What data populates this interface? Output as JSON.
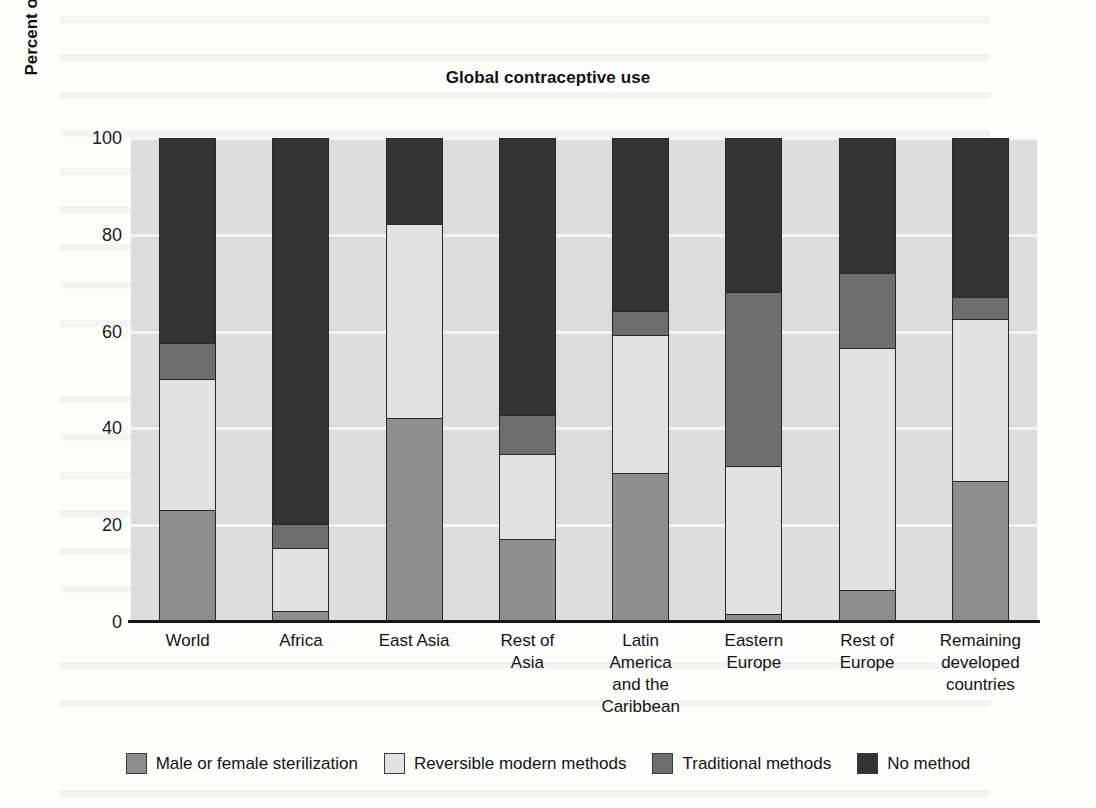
{
  "page": {
    "background_color": "#fdfdfc",
    "plot_background_color": "#dcdcdc",
    "gridline_color": "#f7f7f7"
  },
  "chart_data": {
    "type": "bar",
    "subtype": "stacked-column-100",
    "title": "Global contraceptive use",
    "xlabel": "",
    "ylabel": "Percent of married women ages 15-49",
    "ylim": [
      0,
      100
    ],
    "yticks": [
      0,
      20,
      40,
      60,
      80,
      100
    ],
    "ytick_labels": [
      "0",
      "20",
      "40",
      "60",
      "80",
      "100"
    ],
    "grid": true,
    "legend_position": "bottom",
    "categories": [
      "World",
      "Africa",
      "East Asia",
      "Rest of Asia",
      "Latin America and the Caribbean",
      "Eastern Europe",
      "Rest of Europe",
      "Remaining developed countries"
    ],
    "category_label_lines": [
      [
        "World"
      ],
      [
        "Africa"
      ],
      [
        "East Asia"
      ],
      [
        "Rest of",
        "Asia"
      ],
      [
        "Latin",
        "America",
        "and the",
        "Caribbean"
      ],
      [
        "Eastern",
        "Europe"
      ],
      [
        "Rest of",
        "Europe"
      ],
      [
        "Remaining",
        "developed",
        "countries"
      ]
    ],
    "series": [
      {
        "name": "Male or female sterilization",
        "color": "#8e8e8e",
        "values": [
          23,
          2,
          42,
          17,
          30.5,
          1.5,
          6.5,
          29
        ]
      },
      {
        "name": "Reversible modern methods",
        "color": "#e2e2e2",
        "values": [
          27,
          13,
          40,
          17.5,
          28.5,
          30.5,
          50,
          33.5
        ]
      },
      {
        "name": "Traditional methods",
        "color": "#6e6e6e",
        "values": [
          7.5,
          5,
          0,
          8,
          5,
          36,
          15.5,
          4.5
        ]
      },
      {
        "name": "No method",
        "color": "#333333",
        "values": [
          42.5,
          80,
          18,
          57.5,
          36,
          32,
          28,
          33
        ]
      }
    ]
  },
  "legend": {
    "items": [
      {
        "label": "Male or female sterilization",
        "color": "#8e8e8e"
      },
      {
        "label": "Reversible modern methods",
        "color": "#e2e2e2"
      },
      {
        "label": "Traditional methods",
        "color": "#6e6e6e"
      },
      {
        "label": "No method",
        "color": "#333333"
      }
    ]
  }
}
